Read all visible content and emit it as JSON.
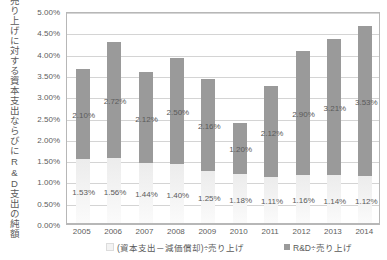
{
  "chart_data": {
    "type": "bar",
    "stacked": true,
    "title": "",
    "xlabel": "",
    "ylabel": "売り上げに対する資本支出ならびにR&D支出の純額",
    "categories": [
      "2005",
      "2006",
      "2007",
      "2008",
      "2009",
      "2010",
      "2011",
      "2012",
      "2013",
      "2014"
    ],
    "ylim": [
      0,
      5.0
    ],
    "ytick_step": 0.5,
    "ytick_labels": [
      "0.00%",
      "0.50%",
      "1.00%",
      "1.50%",
      "2.00%",
      "2.50%",
      "3.00%",
      "3.50%",
      "4.00%",
      "4.50%",
      "5.00%"
    ],
    "ytick_values": [
      0,
      0.5,
      1.0,
      1.5,
      2.0,
      2.5,
      3.0,
      3.5,
      4.0,
      4.5,
      5.0
    ],
    "grid": true,
    "legend_position": "bottom",
    "series": [
      {
        "name": "(資本支出－減価償却)÷売り上げ",
        "color": "#f3f3f3",
        "values": [
          1.53,
          1.56,
          1.44,
          1.4,
          1.25,
          1.18,
          1.11,
          1.16,
          1.14,
          1.12
        ],
        "labels": [
          "1.53%",
          "1.56%",
          "1.44%",
          "1.40%",
          "1.25%",
          "1.18%",
          "1.11%",
          "1.16%",
          "1.14%",
          "1.12%"
        ]
      },
      {
        "name": "R&D÷売り上げ",
        "color": "#9a9a9a",
        "values": [
          2.1,
          2.72,
          2.12,
          2.5,
          2.16,
          1.2,
          2.12,
          2.9,
          3.21,
          3.53
        ],
        "labels": [
          "2.10%",
          "2.72%",
          "2.12%",
          "2.50%",
          "2.16%",
          "1.20%",
          "2.12%",
          "2.90%",
          "3.21%",
          "3.53%"
        ]
      }
    ]
  },
  "legend": {
    "capex_label": "(資本支出－減価償却)÷売り上げ",
    "rd_label": "R&D÷売り上げ"
  }
}
